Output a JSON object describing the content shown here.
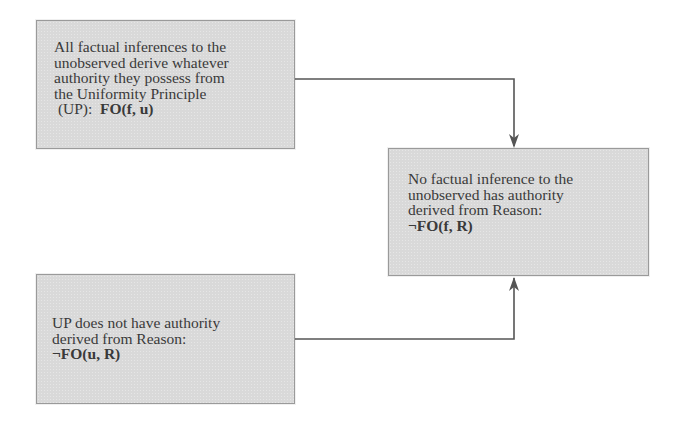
{
  "diagram": {
    "type": "argument-flow",
    "nodes": [
      {
        "id": "premise-1",
        "lines": [
          "All factual inferences to the",
          "unobserved derive whatever",
          "authority they possess from",
          "the Uniformity Principle"
        ],
        "last_line_prefix": " (UP):  ",
        "formula": "FO(f, u)"
      },
      {
        "id": "conclusion",
        "lines": [
          "No factual inference to the",
          "unobserved has authority",
          "derived from Reason:"
        ],
        "formula": "¬FO(f, R)"
      },
      {
        "id": "premise-2",
        "lines": [
          "UP does not have authority",
          "derived from Reason:"
        ],
        "formula": "¬FO(u, R)"
      }
    ],
    "edges": [
      {
        "from": "premise-1",
        "to": "conclusion",
        "arrow": "down"
      },
      {
        "from": "premise-2",
        "to": "conclusion",
        "arrow": "up"
      }
    ],
    "colors": {
      "box_fill": "#d9d9d9",
      "box_border": "#9a9a9a",
      "text": "#3a3a3a",
      "connector": "#555555"
    }
  }
}
